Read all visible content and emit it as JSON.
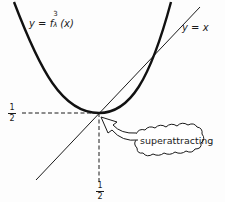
{
  "diagram": {
    "curve_label": "y = f",
    "curve_label_sup": "3",
    "curve_label_sub": "λ",
    "curve_label_arg": "(x)",
    "diagonal_label": "y = x",
    "fixed_point_x_label": {
      "num": "1",
      "den": "2"
    },
    "fixed_point_y_label": {
      "num": "1",
      "den": "2"
    },
    "annotation": "superattracting",
    "colors": {
      "ink": "#1a1a1a",
      "background": "#fdfdfd"
    }
  }
}
